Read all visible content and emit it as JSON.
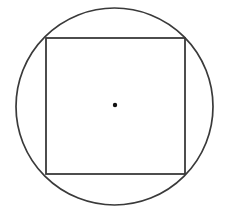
{
  "figure": {
    "background_color": "#ffffff",
    "canvas": {
      "width": 230,
      "height": 218
    },
    "stroke_color": "#3a3a3a",
    "dot_color": "#111111",
    "shapes": [
      {
        "name": "circle",
        "kind": "circle",
        "center_x": 114.5,
        "center_y": 106.5,
        "radius": 98.5,
        "stroke_width": 1.7,
        "fill": "none"
      },
      {
        "name": "square",
        "kind": "rect",
        "x": 46,
        "y": 38,
        "width": 139,
        "height": 136,
        "stroke_width": 1.8,
        "fill": "none"
      },
      {
        "name": "center-dot",
        "kind": "dot",
        "center_x": 115,
        "center_y": 105,
        "radius": 2.2,
        "fill": "#111111"
      }
    ]
  }
}
